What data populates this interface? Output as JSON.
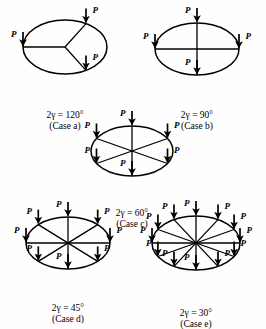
{
  "figure": {
    "background_color": "#fefefe",
    "stroke_color": "#000000",
    "load_label": "P"
  },
  "cases": [
    {
      "id": "case-a",
      "angle_label": "2γ = 120°",
      "name_label": "(Case a)",
      "spoke_count": 3,
      "spacing_deg": 120,
      "spoke_angles_deg": [
        180,
        60,
        300
      ],
      "load_count": 3,
      "cx": 65,
      "cy": 47,
      "rx": 42,
      "ry": 27,
      "cap_x": 65,
      "cap_y": 86
    },
    {
      "id": "case-b",
      "angle_label": "2γ = 90°",
      "name_label": "(Case b)",
      "spoke_count": 4,
      "spacing_deg": 90,
      "spoke_angles_deg": [
        90,
        180,
        270,
        0
      ],
      "load_count": 4,
      "cx": 197,
      "cy": 49,
      "rx": 42,
      "ry": 26,
      "cap_x": 197,
      "cap_y": 86
    },
    {
      "id": "case-c",
      "angle_label": "2γ = 60°",
      "name_label": "(Case c)",
      "spoke_count": 6,
      "spacing_deg": 60,
      "spoke_angles_deg": [
        90,
        150,
        210,
        270,
        330,
        30
      ],
      "load_count": 6,
      "cx": 132,
      "cy": 151,
      "rx": 41,
      "ry": 25,
      "cap_x": 132,
      "cap_y": 184
    },
    {
      "id": "case-d",
      "angle_label": "2γ = 45°",
      "name_label": "(Case d)",
      "spoke_count": 8,
      "spacing_deg": 45,
      "spoke_angles_deg": [
        90,
        135,
        180,
        225,
        270,
        315,
        0,
        45
      ],
      "load_count": 8,
      "cx": 68,
      "cy": 243,
      "rx": 42,
      "ry": 26,
      "cap_x": 68,
      "cap_y": 279
    },
    {
      "id": "case-e",
      "angle_label": "2γ = 30°",
      "name_label": "(Case e)",
      "spoke_count": 12,
      "spacing_deg": 30,
      "spoke_angles_deg": [
        90,
        120,
        150,
        180,
        210,
        240,
        270,
        300,
        330,
        0,
        30,
        60
      ],
      "load_count": 12,
      "cx": 196,
      "cy": 243,
      "rx": 44,
      "ry": 27,
      "cap_x": 196,
      "cap_y": 284
    }
  ]
}
